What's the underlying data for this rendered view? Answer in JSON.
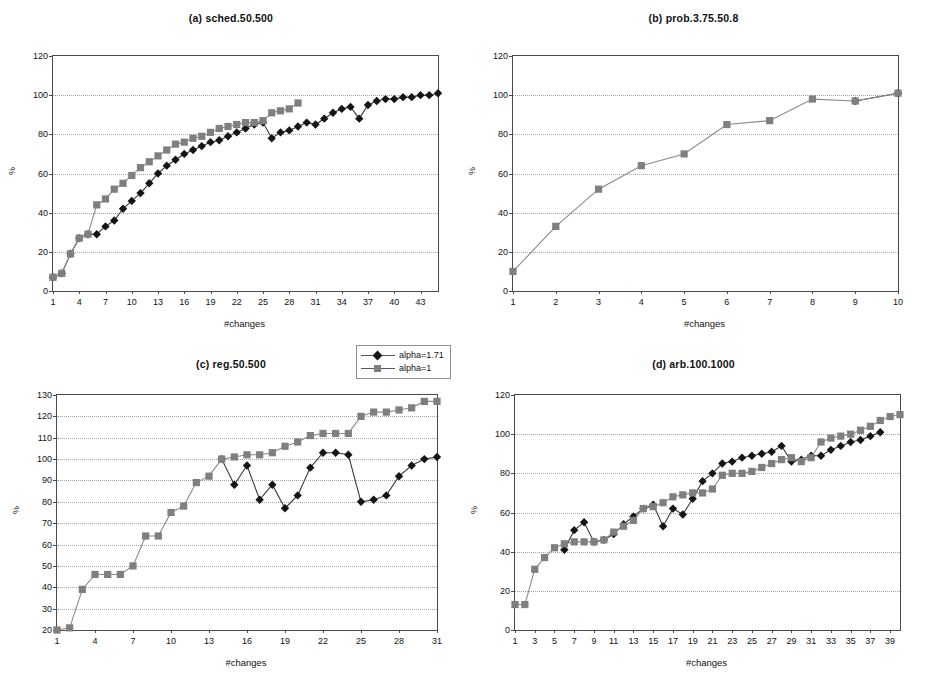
{
  "figure": {
    "background": "#ffffff",
    "series_colors": {
      "alpha_1_71": "#151515",
      "alpha_1": "#7f7f7f"
    },
    "legend": {
      "position": "top-center-right",
      "entries": [
        {
          "label": "alpha=1.71",
          "marker": "diamond",
          "color": "#151515"
        },
        {
          "label": "alpha=1",
          "marker": "square",
          "color": "#7f7f7f"
        }
      ]
    }
  },
  "chart_data": [
    {
      "id": "a",
      "type": "line",
      "title": "(a) sched.50.500",
      "xlabel": "#changes",
      "ylabel": "%",
      "ylim": [
        0,
        120
      ],
      "yticks": [
        0,
        20,
        40,
        60,
        80,
        100,
        120
      ],
      "xlim": [
        1,
        45
      ],
      "xticks": [
        1,
        4,
        7,
        10,
        13,
        16,
        19,
        22,
        25,
        28,
        31,
        34,
        37,
        40,
        43
      ],
      "grid": true,
      "series": [
        {
          "name": "alpha=1.71",
          "marker": "diamond",
          "color": "#151515",
          "x": [
            1,
            2,
            3,
            4,
            5,
            6,
            7,
            8,
            9,
            10,
            11,
            12,
            13,
            14,
            15,
            16,
            17,
            18,
            19,
            20,
            21,
            22,
            23,
            24,
            25,
            26,
            27,
            28,
            29,
            30,
            31,
            32,
            33,
            34,
            35,
            36,
            37,
            38,
            39,
            40,
            41,
            42,
            43,
            44,
            45
          ],
          "values": [
            7,
            9,
            19,
            27,
            29,
            29,
            33,
            36,
            42,
            46,
            50,
            55,
            60,
            64,
            67,
            70,
            72,
            74,
            76,
            77,
            79,
            81,
            83,
            85,
            86,
            78,
            81,
            82,
            84,
            86,
            85,
            88,
            91,
            93,
            94,
            88,
            95,
            97,
            98,
            98,
            99,
            99,
            100,
            100,
            101
          ]
        },
        {
          "name": "alpha=1",
          "marker": "square",
          "color": "#7f7f7f",
          "x": [
            1,
            2,
            3,
            4,
            5,
            6,
            7,
            8,
            9,
            10,
            11,
            12,
            13,
            14,
            15,
            16,
            17,
            18,
            19,
            20,
            21,
            22,
            23,
            24,
            25,
            26,
            27,
            28,
            29
          ],
          "values": [
            7,
            9,
            19,
            27,
            29,
            44,
            47,
            52,
            55,
            59,
            63,
            66,
            69,
            72,
            75,
            76,
            78,
            79,
            81,
            83,
            84,
            85,
            86,
            86,
            87,
            91,
            92,
            93,
            96
          ]
        }
      ]
    },
    {
      "id": "b",
      "type": "line",
      "title": "(b) prob.3.75.50.8",
      "xlabel": "#changes",
      "ylabel": "%",
      "ylim": [
        0,
        120
      ],
      "yticks": [
        0,
        20,
        40,
        60,
        80,
        100,
        120
      ],
      "xlim": [
        1,
        10
      ],
      "xticks": [
        1,
        2,
        3,
        4,
        5,
        6,
        7,
        8,
        9,
        10
      ],
      "grid": true,
      "series": [
        {
          "name": "alpha=1.71",
          "marker": "diamond",
          "color": "#151515",
          "x": [
            9,
            10
          ],
          "values": [
            97,
            101
          ]
        },
        {
          "name": "alpha=1",
          "marker": "square",
          "color": "#7f7f7f",
          "x": [
            1,
            2,
            3,
            4,
            5,
            6,
            7,
            8,
            9,
            10
          ],
          "values": [
            10,
            33,
            52,
            64,
            70,
            85,
            87,
            98,
            97,
            101
          ]
        }
      ]
    },
    {
      "id": "c",
      "type": "line",
      "title": "(c) reg.50.500",
      "xlabel": "#changes",
      "ylabel": "%",
      "ylim": [
        20,
        130
      ],
      "yticks": [
        20,
        30,
        40,
        50,
        60,
        70,
        80,
        90,
        100,
        110,
        120,
        130
      ],
      "xlim": [
        1,
        31
      ],
      "xticks": [
        1,
        4,
        7,
        10,
        13,
        16,
        19,
        22,
        25,
        28,
        31
      ],
      "grid": true,
      "series": [
        {
          "name": "alpha=1.71",
          "marker": "diamond",
          "color": "#151515",
          "x": [
            14,
            15,
            16,
            17,
            18,
            19,
            20,
            21,
            22,
            23,
            24,
            25,
            26,
            27,
            28,
            29,
            30,
            31
          ],
          "values": [
            100,
            88,
            97,
            81,
            88,
            77,
            83,
            96,
            103,
            103,
            102,
            80,
            81,
            83,
            92,
            97,
            100,
            101
          ]
        },
        {
          "name": "alpha=1",
          "marker": "square",
          "color": "#7f7f7f",
          "x": [
            1,
            2,
            3,
            4,
            5,
            6,
            7,
            8,
            9,
            10,
            11,
            12,
            13,
            14,
            15,
            16,
            17,
            18,
            19,
            20,
            21,
            22,
            23,
            24,
            25,
            26,
            27,
            28,
            29,
            30,
            31
          ],
          "values": [
            20,
            21,
            39,
            46,
            46,
            46,
            50,
            64,
            64,
            75,
            78,
            89,
            92,
            100,
            101,
            102,
            102,
            103,
            106,
            108,
            111,
            112,
            112,
            112,
            120,
            122,
            122,
            123,
            124,
            127,
            127
          ]
        }
      ]
    },
    {
      "id": "d",
      "type": "line",
      "title": "(d) arb.100.1000",
      "xlabel": "#changes",
      "ylabel": "%",
      "ylim": [
        0,
        120
      ],
      "yticks": [
        0,
        20,
        40,
        60,
        80,
        100,
        120
      ],
      "xlim": [
        1,
        40
      ],
      "xticks": [
        1,
        3,
        5,
        7,
        9,
        11,
        13,
        15,
        17,
        19,
        21,
        23,
        25,
        27,
        29,
        31,
        33,
        35,
        37,
        39
      ],
      "grid": true,
      "series": [
        {
          "name": "alpha=1.71",
          "marker": "diamond",
          "color": "#151515",
          "x": [
            6,
            7,
            8,
            9,
            10,
            11,
            12,
            13,
            14,
            15,
            16,
            17,
            18,
            19,
            20,
            21,
            22,
            23,
            24,
            25,
            26,
            27,
            28,
            29,
            30,
            31,
            32,
            33,
            34,
            35,
            36,
            37,
            38
          ],
          "values": [
            41,
            51,
            55,
            45,
            46,
            49,
            54,
            58,
            62,
            64,
            53,
            62,
            59,
            67,
            76,
            80,
            85,
            86,
            88,
            89,
            90,
            91,
            94,
            86,
            87,
            89,
            89,
            92,
            94,
            96,
            97,
            99,
            101
          ]
        },
        {
          "name": "alpha=1",
          "marker": "square",
          "color": "#7f7f7f",
          "x": [
            1,
            2,
            3,
            4,
            5,
            6,
            7,
            8,
            9,
            10,
            11,
            12,
            13,
            14,
            15,
            16,
            17,
            18,
            19,
            20,
            21,
            22,
            23,
            24,
            25,
            26,
            27,
            28,
            29,
            30,
            31,
            32,
            33,
            34,
            35,
            36,
            37,
            38,
            39,
            40
          ],
          "values": [
            13,
            13,
            31,
            37,
            42,
            44,
            45,
            45,
            45,
            46,
            50,
            53,
            56,
            62,
            63,
            65,
            68,
            69,
            70,
            70,
            72,
            79,
            80,
            80,
            81,
            83,
            85,
            87,
            88,
            86,
            88,
            96,
            98,
            99,
            100,
            102,
            104,
            107,
            109,
            110
          ]
        }
      ]
    }
  ]
}
